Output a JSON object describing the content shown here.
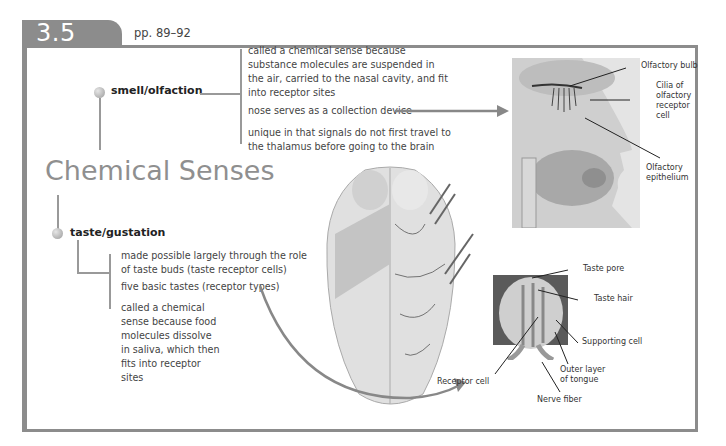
{
  "section": {
    "number": "3.5",
    "pages": "pp. 89–92"
  },
  "title": "Chemical Senses",
  "smell": {
    "heading": "smell/olfaction",
    "items": [
      "called a chemical sense because substance molecules are suspended in the air, carried to the nasal cavity, and fit into receptor sites",
      "nose serves as a collection device",
      "unique in that signals do not first travel to the thalamus before going to the brain"
    ],
    "diagram_labels": [
      "Olfactory bulb",
      "Cilia of olfactory receptor cell",
      "Olfactory epithelium"
    ]
  },
  "taste": {
    "heading": "taste/gustation",
    "items": [
      "made possible largely through the role of taste buds (taste receptor cells)",
      "five basic tastes (receptor types)",
      "called a chemical sense because food molecules dissolve in saliva, which then fits into receptor sites"
    ],
    "diagram_labels": [
      "Taste pore",
      "Taste hair",
      "Supporting cell",
      "Outer layer of tongue",
      "Nerve fiber",
      "Receptor cell"
    ]
  },
  "colors": {
    "frame": "#8c8c8c",
    "title": "#8f8f8f",
    "connector": "#999999",
    "arrow": "#888888"
  }
}
